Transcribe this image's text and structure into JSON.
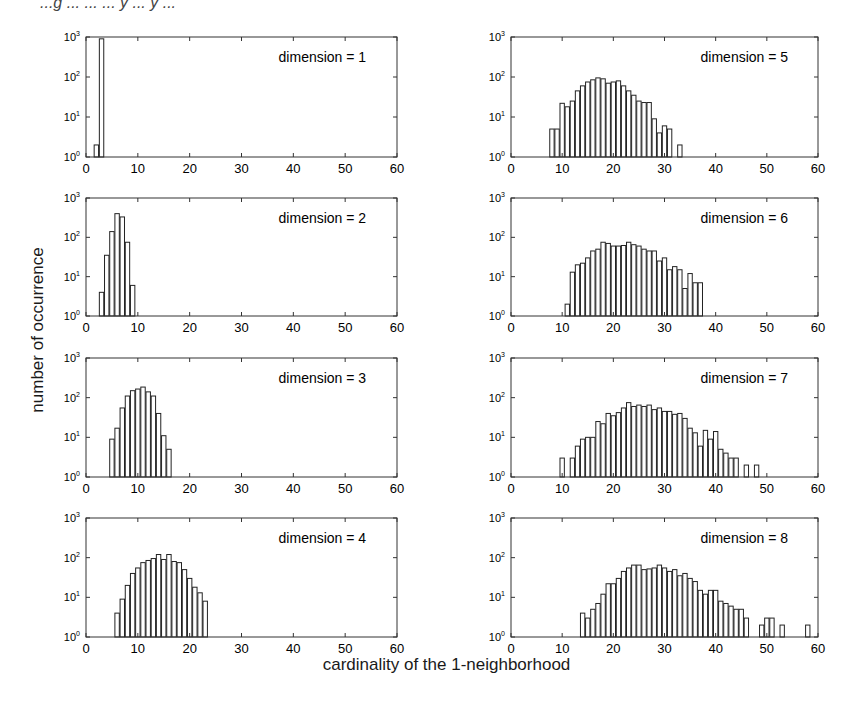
{
  "page": {
    "header_fragment": "...g ... ... ... y ... y ...",
    "ylabel": "number of occurrence",
    "xlabel": "cardinality of the 1-neighborhood"
  },
  "chart_data": [
    {
      "type": "bar",
      "title": "dimension = 1",
      "xlim": [
        0,
        60
      ],
      "ylim_log": [
        1,
        1000
      ],
      "yscale": "log",
      "xticks": [
        0,
        10,
        20,
        30,
        40,
        50,
        60
      ],
      "yticks": [
        "10^0",
        "10^1",
        "10^2",
        "10^3"
      ],
      "x": [
        2,
        3
      ],
      "values": [
        2,
        900
      ]
    },
    {
      "type": "bar",
      "title": "dimension = 2",
      "xlim": [
        0,
        60
      ],
      "ylim_log": [
        1,
        1000
      ],
      "yscale": "log",
      "xticks": [
        0,
        10,
        20,
        30,
        40,
        50,
        60
      ],
      "yticks": [
        "10^0",
        "10^1",
        "10^2",
        "10^3"
      ],
      "x": [
        3,
        4,
        5,
        6,
        7,
        8,
        9
      ],
      "values": [
        4,
        35,
        140,
        400,
        330,
        75,
        6
      ]
    },
    {
      "type": "bar",
      "title": "dimension = 3",
      "xlim": [
        0,
        60
      ],
      "ylim_log": [
        1,
        1000
      ],
      "yscale": "log",
      "xticks": [
        0,
        10,
        20,
        30,
        40,
        50,
        60
      ],
      "yticks": [
        "10^0",
        "10^1",
        "10^2",
        "10^3"
      ],
      "x": [
        5,
        6,
        7,
        8,
        9,
        10,
        11,
        12,
        13,
        14,
        15,
        16
      ],
      "values": [
        9,
        17,
        55,
        110,
        150,
        165,
        185,
        140,
        110,
        40,
        11,
        5
      ]
    },
    {
      "type": "bar",
      "title": "dimension = 4",
      "xlim": [
        0,
        60
      ],
      "ylim_log": [
        1,
        1000
      ],
      "yscale": "log",
      "xticks": [
        0,
        10,
        20,
        30,
        40,
        50,
        60
      ],
      "yticks": [
        "10^0",
        "10^1",
        "10^2",
        "10^3"
      ],
      "x": [
        6,
        7,
        8,
        9,
        10,
        11,
        12,
        13,
        14,
        15,
        16,
        17,
        18,
        19,
        20,
        21,
        22,
        23
      ],
      "values": [
        4,
        9,
        20,
        40,
        55,
        75,
        85,
        95,
        120,
        90,
        120,
        80,
        75,
        50,
        30,
        18,
        13,
        8
      ]
    },
    {
      "type": "bar",
      "title": "dimension = 5",
      "xlim": [
        0,
        60
      ],
      "ylim_log": [
        1,
        1000
      ],
      "yscale": "log",
      "xticks": [
        0,
        10,
        20,
        30,
        40,
        50,
        60
      ],
      "yticks": [
        "10^0",
        "10^1",
        "10^2",
        "10^3"
      ],
      "x": [
        8,
        9,
        10,
        11,
        12,
        13,
        14,
        15,
        16,
        17,
        18,
        19,
        20,
        21,
        22,
        23,
        24,
        25,
        26,
        27,
        28,
        29,
        30,
        31,
        33
      ],
      "values": [
        5,
        5,
        22,
        18,
        25,
        45,
        60,
        75,
        85,
        95,
        90,
        70,
        75,
        80,
        60,
        45,
        35,
        25,
        23,
        23,
        9,
        4,
        6,
        5,
        2
      ]
    },
    {
      "type": "bar",
      "title": "dimension = 6",
      "xlim": [
        0,
        60
      ],
      "ylim_log": [
        1,
        1000
      ],
      "yscale": "log",
      "xticks": [
        0,
        10,
        20,
        30,
        40,
        50,
        60
      ],
      "yticks": [
        "10^0",
        "10^1",
        "10^2",
        "10^3"
      ],
      "x": [
        11,
        12,
        13,
        14,
        15,
        16,
        17,
        18,
        19,
        20,
        21,
        22,
        23,
        24,
        25,
        26,
        27,
        28,
        29,
        30,
        31,
        32,
        33,
        34,
        35,
        36,
        37
      ],
      "values": [
        2,
        13,
        20,
        22,
        30,
        45,
        50,
        75,
        70,
        60,
        60,
        62,
        75,
        65,
        60,
        50,
        45,
        45,
        25,
        30,
        15,
        18,
        15,
        5,
        12,
        7,
        7
      ]
    },
    {
      "type": "bar",
      "title": "dimension = 7",
      "xlim": [
        0,
        60
      ],
      "ylim_log": [
        1,
        1000
      ],
      "yscale": "log",
      "xticks": [
        0,
        10,
        20,
        30,
        40,
        50,
        60
      ],
      "yticks": [
        "10^0",
        "10^1",
        "10^2",
        "10^3"
      ],
      "x": [
        10,
        12,
        13,
        14,
        15,
        16,
        17,
        18,
        19,
        20,
        21,
        22,
        23,
        24,
        25,
        26,
        27,
        28,
        29,
        30,
        31,
        32,
        33,
        34,
        35,
        36,
        37,
        38,
        39,
        40,
        41,
        42,
        43,
        44,
        46,
        48
      ],
      "values": [
        3,
        3,
        6,
        9,
        10,
        10,
        25,
        22,
        40,
        35,
        42,
        55,
        75,
        60,
        65,
        60,
        65,
        50,
        55,
        45,
        45,
        38,
        40,
        30,
        17,
        13,
        6,
        15,
        9,
        14,
        5,
        4,
        3,
        3,
        2,
        2
      ]
    },
    {
      "type": "bar",
      "title": "dimension = 8",
      "xlim": [
        0,
        60
      ],
      "ylim_log": [
        1,
        1000
      ],
      "yscale": "log",
      "xticks": [
        0,
        10,
        20,
        30,
        40,
        50,
        60
      ],
      "yticks": [
        "10^0",
        "10^1",
        "10^2",
        "10^3"
      ],
      "x": [
        14,
        15,
        16,
        17,
        18,
        19,
        20,
        21,
        22,
        23,
        24,
        25,
        26,
        27,
        28,
        29,
        30,
        31,
        32,
        33,
        34,
        35,
        36,
        37,
        38,
        39,
        40,
        41,
        42,
        43,
        44,
        45,
        46,
        49,
        50,
        51,
        53,
        58
      ],
      "values": [
        4,
        3,
        5,
        7,
        12,
        22,
        22,
        30,
        45,
        55,
        65,
        65,
        50,
        52,
        55,
        65,
        55,
        45,
        50,
        35,
        40,
        30,
        25,
        15,
        12,
        15,
        15,
        8,
        7,
        6,
        5,
        5,
        3,
        2,
        3,
        3,
        2,
        2
      ]
    }
  ]
}
